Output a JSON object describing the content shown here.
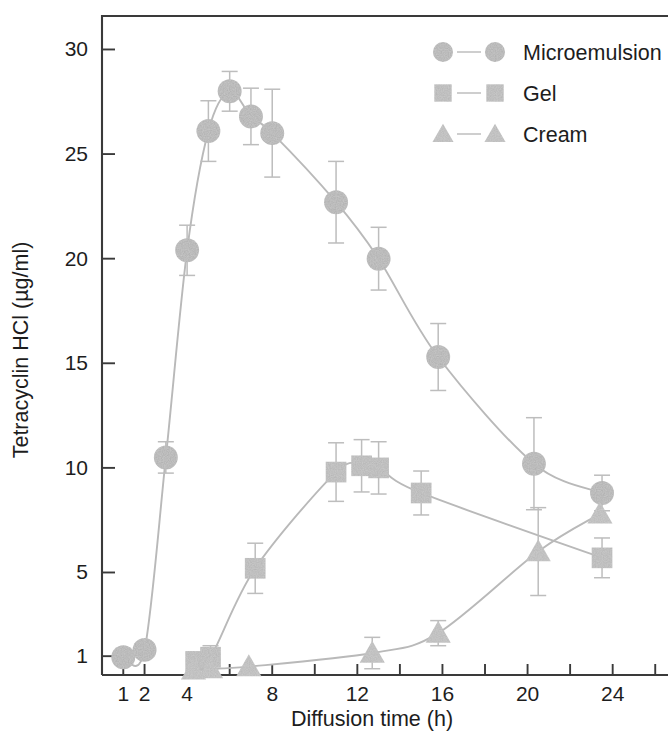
{
  "chart_data": {
    "type": "line",
    "title": "",
    "xlabel": "Diffusion time (h)",
    "ylabel": "Tetracyclin HCl (µg/ml)",
    "xlim": [
      0,
      26.6
    ],
    "ylim": [
      0.1,
      31.6
    ],
    "grid": false,
    "legend_position": "top-right",
    "x_ticks": [
      1,
      2,
      4,
      6,
      8,
      10,
      12,
      14,
      16,
      18,
      20,
      22,
      24,
      26
    ],
    "x_tick_labels": [
      "1",
      "2",
      "4",
      "",
      "8",
      "",
      "12",
      "",
      "16",
      "",
      "20",
      "",
      "24",
      ""
    ],
    "y_ticks": [
      1,
      5,
      10,
      15,
      20,
      25,
      30
    ],
    "y_tick_labels": [
      "1",
      "5",
      "10",
      "15",
      "20",
      "25",
      "30"
    ],
    "series": [
      {
        "name": "Microemulsion",
        "marker": "circle",
        "color": "#a9a9a9",
        "x": [
          1,
          2,
          3,
          4,
          5,
          6,
          7,
          8,
          11,
          13,
          15.8,
          20.3,
          23.5
        ],
        "values": [
          0.95,
          1.3,
          10.5,
          20.4,
          26.1,
          28.0,
          26.8,
          26.0,
          22.7,
          20.0,
          15.3,
          10.2,
          8.8
        ],
        "errors": [
          0.0,
          0.0,
          0.75,
          1.2,
          1.45,
          0.95,
          1.35,
          2.1,
          1.95,
          1.5,
          1.6,
          2.2,
          0.85
        ]
      },
      {
        "name": "Gel",
        "marker": "square",
        "color": "#b0b0b0",
        "x": [
          4.4,
          5.1,
          7.2,
          11,
          12.2,
          13,
          15,
          23.5
        ],
        "values": [
          0.75,
          0.95,
          5.2,
          9.8,
          10.1,
          10.0,
          8.8,
          5.7
        ],
        "errors": [
          0.0,
          0.55,
          1.2,
          1.4,
          1.25,
          1.25,
          1.05,
          0.95
        ]
      },
      {
        "name": "Cream",
        "marker": "triangle",
        "color": "#b4b4b4",
        "x": [
          4.3,
          5.1,
          6.9,
          12.7,
          15.8,
          20.5,
          23.4
        ],
        "values": [
          0.35,
          0.4,
          0.5,
          1.15,
          2.1,
          6.0,
          7.8
        ],
        "errors": [
          0.0,
          0.0,
          0.0,
          0.75,
          0.6,
          2.1,
          0.0
        ]
      }
    ]
  },
  "legend": {
    "items": [
      {
        "label": "Microemulsion",
        "marker": "circle"
      },
      {
        "label": "Gel",
        "marker": "square"
      },
      {
        "label": "Cream",
        "marker": "triangle"
      }
    ]
  }
}
